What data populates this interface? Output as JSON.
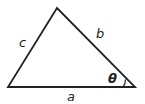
{
  "diagram": {
    "type": "triangle",
    "vertices": {
      "apex": [
        57,
        8
      ],
      "bottom_left": [
        8,
        87
      ],
      "bottom_right": [
        135,
        87
      ]
    },
    "sides": {
      "a": {
        "label": "a",
        "between": [
          "bottom_left",
          "bottom_right"
        ]
      },
      "b": {
        "label": "b",
        "between": [
          "apex",
          "bottom_right"
        ]
      },
      "c": {
        "label": "c",
        "between": [
          "apex",
          "bottom_left"
        ]
      }
    },
    "angle": {
      "label": "θ",
      "vertex": "bottom_right"
    },
    "stroke_color": "#222222",
    "background": "#ffffff"
  }
}
